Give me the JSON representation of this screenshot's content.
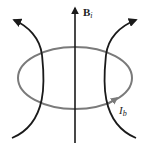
{
  "diagram": {
    "field_label": "B",
    "field_subscript": "i",
    "current_label": "I",
    "current_subscript": "b",
    "colors": {
      "field_lines": "#1a1a1a",
      "loop": "#7a7a7a",
      "background": "#ffffff"
    }
  }
}
